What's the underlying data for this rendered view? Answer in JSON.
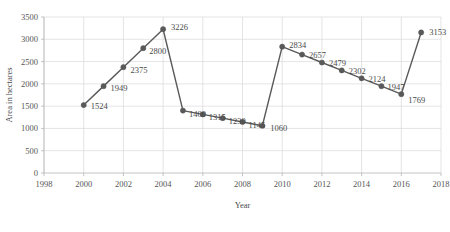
{
  "chart_data": {
    "type": "line",
    "title": "",
    "xlabel": "Year",
    "ylabel": "Area in hectares",
    "xlim": [
      1998,
      2018
    ],
    "ylim": [
      0,
      3500
    ],
    "xticks": [
      1998,
      2000,
      2002,
      2004,
      2006,
      2008,
      2010,
      2012,
      2014,
      2016,
      2018
    ],
    "yticks": [
      0,
      500,
      1000,
      1500,
      2000,
      2500,
      3000,
      3500
    ],
    "grid": true,
    "legend": "none",
    "series_color": "#595959",
    "marker": "circle",
    "x": [
      2000,
      2001,
      2002,
      2003,
      2004,
      2005,
      2006,
      2007,
      2008,
      2009,
      2010,
      2011,
      2012,
      2013,
      2014,
      2015,
      2016,
      2017
    ],
    "values": [
      1524,
      1949,
      2375,
      2800,
      3226,
      1400,
      1315,
      1230,
      1145,
      1060,
      2834,
      2657,
      2479,
      2302,
      2124,
      1947,
      1769,
      3153
    ],
    "point_labels": [
      "1524",
      "1949",
      "2375",
      "2800",
      "3226",
      "1400",
      "1315",
      "1230",
      "1145",
      "1060",
      "2834",
      "2657",
      "2479",
      "2302",
      "2124",
      "1947",
      "1769",
      "3153"
    ],
    "label_offsets": [
      {
        "dx": 7,
        "dy": 4
      },
      {
        "dx": 7,
        "dy": 5
      },
      {
        "dx": 7,
        "dy": 6
      },
      {
        "dx": 6,
        "dy": 6
      },
      {
        "dx": 8,
        "dy": 1
      },
      {
        "dx": 6,
        "dy": 6
      },
      {
        "dx": 6,
        "dy": 6
      },
      {
        "dx": 6,
        "dy": 6
      },
      {
        "dx": 6,
        "dy": 6
      },
      {
        "dx": 8,
        "dy": 5
      },
      {
        "dx": 7,
        "dy": 1
      },
      {
        "dx": 7,
        "dy": 3
      },
      {
        "dx": 7,
        "dy": 3
      },
      {
        "dx": 7,
        "dy": 4
      },
      {
        "dx": 7,
        "dy": 4
      },
      {
        "dx": 6,
        "dy": 4
      },
      {
        "dx": 7,
        "dy": 9
      },
      {
        "dx": 8,
        "dy": 3
      }
    ]
  }
}
